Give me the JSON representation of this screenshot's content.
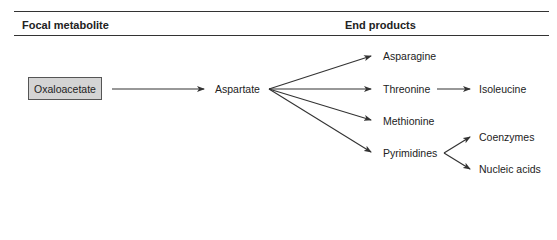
{
  "table_header": {
    "left": "Focal metabolite",
    "right": "End products"
  },
  "nodes": {
    "focal": "Oxaloacetate",
    "intermediate": "Aspartate",
    "products": [
      "Asparagine",
      "Threonine",
      "Methionine",
      "Pyrimidines"
    ],
    "threonine_product": "Isoleucine",
    "pyrimidine_products": [
      "Coenzymes",
      "Nucleic acids"
    ]
  },
  "edges": [
    {
      "from": "Oxaloacetate",
      "to": "Aspartate"
    },
    {
      "from": "Aspartate",
      "to": "Asparagine"
    },
    {
      "from": "Aspartate",
      "to": "Threonine"
    },
    {
      "from": "Aspartate",
      "to": "Methionine"
    },
    {
      "from": "Aspartate",
      "to": "Pyrimidines"
    },
    {
      "from": "Threonine",
      "to": "Isoleucine"
    },
    {
      "from": "Pyrimidines",
      "to": "Coenzymes"
    },
    {
      "from": "Pyrimidines",
      "to": "Nucleic acids"
    }
  ],
  "colors": {
    "box_fill": "#d4d4d4",
    "line": "#333333"
  }
}
